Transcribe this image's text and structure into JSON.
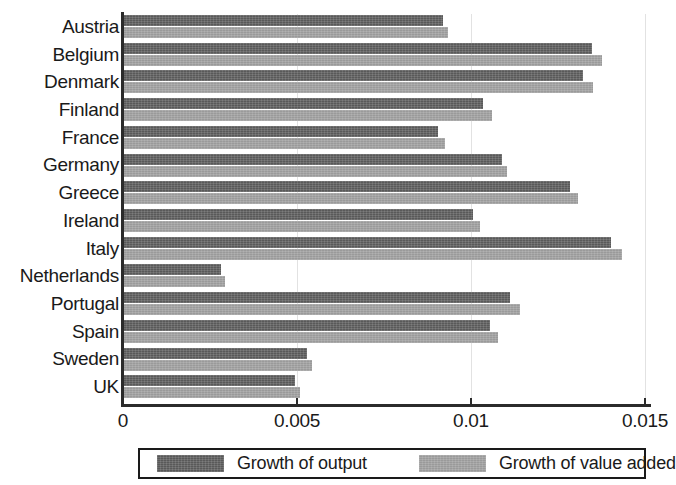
{
  "chart_data": {
    "type": "bar",
    "orientation": "horizontal",
    "title": "",
    "subtitle": "",
    "xlabel": "",
    "ylabel": "",
    "xlim": [
      0,
      0.015
    ],
    "ylim": null,
    "grid": true,
    "grid_axis": "x",
    "legend_position": "bottom",
    "xticks": [
      "0",
      "0.005",
      "0.01",
      "0.015"
    ],
    "xtick_values": [
      0,
      0.005,
      0.01,
      0.015
    ],
    "categories": [
      "Austria",
      "Belgium",
      "Denmark",
      "Finland",
      "France",
      "Germany",
      "Greece",
      "Ireland",
      "Italy",
      "Netherlands",
      "Portugal",
      "Spain",
      "Sweden",
      "UK"
    ],
    "series": [
      {
        "name": "Growth of output",
        "color": "#595959",
        "values": [
          0.0092,
          0.01348,
          0.01322,
          0.01034,
          0.00905,
          0.0109,
          0.01284,
          0.01006,
          0.01402,
          0.00282,
          0.01112,
          0.01055,
          0.00529,
          0.00494
        ]
      },
      {
        "name": "Growth of value added",
        "color": "#9a9a9a",
        "values": [
          0.00934,
          0.01376,
          0.01351,
          0.0106,
          0.00925,
          0.01103,
          0.01307,
          0.01026,
          0.01434,
          0.00293,
          0.01141,
          0.01077,
          0.00543,
          0.00509
        ]
      }
    ]
  },
  "legend": {
    "entries": [
      {
        "label": "Growth of output"
      },
      {
        "label": "Growth of value added"
      }
    ]
  }
}
